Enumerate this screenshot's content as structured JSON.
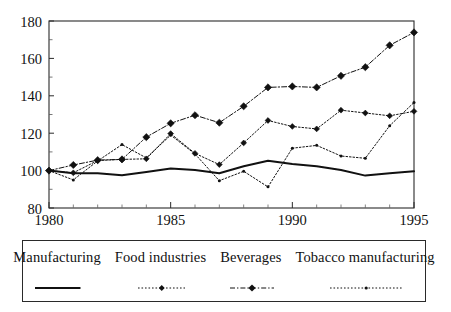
{
  "chart_data": {
    "type": "line",
    "title": "",
    "subtitle": "",
    "xlabel": "",
    "ylabel": "",
    "x": [
      1980,
      1981,
      1982,
      1983,
      1984,
      1985,
      1986,
      1987,
      1988,
      1989,
      1990,
      1991,
      1992,
      1993,
      1994,
      1995
    ],
    "xlim": [
      1980,
      1995
    ],
    "ylim": [
      80,
      180
    ],
    "xticks": [
      1980,
      1985,
      1990,
      1995
    ],
    "xtick_labels": [
      "1980",
      "1985",
      "1990",
      "1995"
    ],
    "xticks_minor": [
      1981,
      1982,
      1983,
      1984,
      1986,
      1987,
      1988,
      1989,
      1991,
      1992,
      1993,
      1994
    ],
    "yticks": [
      80,
      100,
      120,
      140,
      160,
      180
    ],
    "ytick_labels": [
      "80",
      "100",
      "120",
      "140",
      "160",
      "180"
    ],
    "grid": false,
    "legend_position": "bottom",
    "index_base": 100,
    "series": [
      {
        "name": "Manufacturing",
        "style": "solid",
        "marker": "none",
        "color": "#111111",
        "values": [
          100,
          98.6,
          98.6,
          97.5,
          99.3,
          101.1,
          100.3,
          98.6,
          102.3,
          105.3,
          103.6,
          102.3,
          100.3,
          97.3,
          98.6,
          99.6
        ]
      },
      {
        "name": "Food industries",
        "style": "dotted",
        "marker": "diamond-small",
        "color": "#111111",
        "values": [
          100,
          98.8,
          105.4,
          106.0,
          106.3,
          119.8,
          109.2,
          103.2,
          114.8,
          126.8,
          123.6,
          122.3,
          132.3,
          130.8,
          129.3,
          131.7
        ]
      },
      {
        "name": "Beverages",
        "style": "dashdot",
        "marker": "diamond-large",
        "color": "#111111",
        "values": [
          100,
          103.0,
          105.6,
          106.0,
          117.9,
          125.3,
          129.6,
          125.6,
          134.4,
          144.5,
          145.0,
          144.5,
          150.7,
          155.3,
          167.0,
          173.9
        ]
      },
      {
        "name": "Tobacco manufacturing",
        "style": "dotted",
        "marker": "dot-small",
        "color": "#111111",
        "values": [
          100,
          95.0,
          105.2,
          113.9,
          106.8,
          119.0,
          108.9,
          94.6,
          99.6,
          91.3,
          112.0,
          113.5,
          107.8,
          106.6,
          124.0,
          136.4
        ]
      }
    ]
  },
  "legend": {
    "items": [
      {
        "label": "Manufacturing",
        "sample": "solid-line-sample"
      },
      {
        "label": "Food industries",
        "sample": "dotted-diamond-sample"
      },
      {
        "label": "Beverages",
        "sample": "dashdot-diamond-sample"
      },
      {
        "label": "Tobacco manufacturing",
        "sample": "dotted-dot-sample"
      }
    ]
  }
}
